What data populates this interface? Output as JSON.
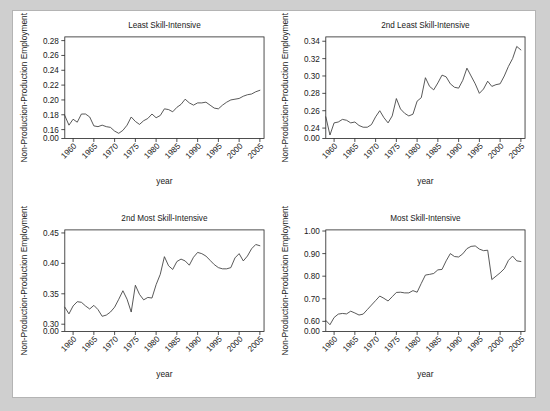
{
  "figure": {
    "background_color": "#cfcfcf",
    "panel_color": "#ffffff",
    "border_color": "#b4b4b4",
    "line_color": "#3a3a3a",
    "axis_color": "#222222"
  },
  "chart_data": [
    {
      "type": "line",
      "title": "Least Skill-Intensive",
      "xlabel": "year",
      "ylabel": "Non-Production-Production Employment",
      "grid": false,
      "legend": null,
      "xlim": [
        1958,
        2006
      ],
      "ylim": [
        0.148,
        0.285
      ],
      "xticks": [
        1960,
        1965,
        1970,
        1975,
        1980,
        1985,
        1990,
        1995,
        2000,
        2005
      ],
      "xtick_labels": [
        "1960",
        "1965",
        "1970",
        "1975",
        "1980",
        "1985",
        "1990",
        "1995",
        "2000",
        "2005"
      ],
      "yticks": [
        0.0,
        0.16,
        0.18,
        0.2,
        0.22,
        0.24,
        0.26,
        0.28
      ],
      "ytick_labels": [
        "0.00",
        "0.16",
        "0.18",
        "0.20",
        "0.22",
        "0.24",
        "0.26",
        "0.28"
      ],
      "x": [
        1958,
        1959,
        1960,
        1961,
        1962,
        1963,
        1964,
        1965,
        1966,
        1967,
        1968,
        1969,
        1970,
        1971,
        1972,
        1973,
        1974,
        1975,
        1976,
        1977,
        1978,
        1979,
        1980,
        1981,
        1982,
        1983,
        1984,
        1985,
        1986,
        1987,
        1988,
        1989,
        1990,
        1991,
        1992,
        1993,
        1994,
        1995,
        1996,
        1997,
        1998,
        1999,
        2000,
        2001,
        2002,
        2003,
        2004,
        2005
      ],
      "values": [
        0.179,
        0.166,
        0.174,
        0.17,
        0.181,
        0.181,
        0.177,
        0.165,
        0.164,
        0.166,
        0.164,
        0.163,
        0.158,
        0.155,
        0.159,
        0.166,
        0.177,
        0.171,
        0.167,
        0.172,
        0.175,
        0.181,
        0.176,
        0.179,
        0.188,
        0.187,
        0.184,
        0.19,
        0.194,
        0.201,
        0.196,
        0.193,
        0.196,
        0.196,
        0.197,
        0.193,
        0.189,
        0.188,
        0.193,
        0.197,
        0.2,
        0.201,
        0.202,
        0.205,
        0.207,
        0.208,
        0.211,
        0.213
      ]
    },
    {
      "type": "line",
      "title": "2nd Least Skill-Intensive",
      "xlabel": "year",
      "ylabel": "Non-Production-Production Employment",
      "grid": false,
      "legend": null,
      "xlim": [
        1958,
        2006
      ],
      "ylim": [
        0.228,
        0.345
      ],
      "xticks": [
        1960,
        1965,
        1970,
        1975,
        1980,
        1985,
        1990,
        1995,
        2000,
        2005
      ],
      "xtick_labels": [
        "1960",
        "1965",
        "1970",
        "1975",
        "1980",
        "1985",
        "1990",
        "1995",
        "2000",
        "2005"
      ],
      "yticks": [
        0.0,
        0.24,
        0.26,
        0.28,
        0.3,
        0.32,
        0.34
      ],
      "ytick_labels": [
        "0.00",
        "0.24",
        "0.26",
        "0.28",
        "0.30",
        "0.32",
        "0.34"
      ],
      "x": [
        1958,
        1959,
        1960,
        1961,
        1962,
        1963,
        1964,
        1965,
        1966,
        1967,
        1968,
        1969,
        1970,
        1971,
        1972,
        1973,
        1974,
        1975,
        1976,
        1977,
        1978,
        1979,
        1980,
        1981,
        1982,
        1983,
        1984,
        1985,
        1986,
        1987,
        1988,
        1989,
        1990,
        1991,
        1992,
        1993,
        1994,
        1995,
        1996,
        1997,
        1998,
        1999,
        2000,
        2001,
        2002,
        2003,
        2004,
        2005
      ],
      "values": [
        0.253,
        0.232,
        0.246,
        0.247,
        0.25,
        0.249,
        0.246,
        0.247,
        0.243,
        0.241,
        0.241,
        0.244,
        0.253,
        0.26,
        0.252,
        0.246,
        0.254,
        0.274,
        0.262,
        0.257,
        0.254,
        0.256,
        0.271,
        0.275,
        0.298,
        0.288,
        0.284,
        0.292,
        0.301,
        0.299,
        0.291,
        0.287,
        0.286,
        0.295,
        0.309,
        0.3,
        0.291,
        0.28,
        0.285,
        0.294,
        0.288,
        0.29,
        0.291,
        0.3,
        0.311,
        0.32,
        0.334,
        0.33
      ]
    },
    {
      "type": "line",
      "title": "2nd Most Skill-Intensive",
      "xlabel": "year",
      "ylabel": "Non-Production-Production Employment",
      "grid": false,
      "legend": null,
      "xlim": [
        1958,
        2006
      ],
      "ylim": [
        0.288,
        0.455
      ],
      "xticks": [
        1960,
        1965,
        1970,
        1975,
        1980,
        1985,
        1990,
        1995,
        2000,
        2005
      ],
      "xtick_labels": [
        "1960",
        "1965",
        "1970",
        "1975",
        "1980",
        "1985",
        "1990",
        "1995",
        "2000",
        "2005"
      ],
      "yticks": [
        0.0,
        0.3,
        0.35,
        0.4,
        0.45
      ],
      "ytick_labels": [
        "0.00",
        "0.30",
        "0.35",
        "0.40",
        "0.45"
      ],
      "x": [
        1958,
        1959,
        1960,
        1961,
        1962,
        1963,
        1964,
        1965,
        1966,
        1967,
        1968,
        1969,
        1970,
        1971,
        1972,
        1973,
        1974,
        1975,
        1976,
        1977,
        1978,
        1979,
        1980,
        1981,
        1982,
        1983,
        1984,
        1985,
        1986,
        1987,
        1988,
        1989,
        1990,
        1991,
        1992,
        1993,
        1994,
        1995,
        1996,
        1997,
        1998,
        1999,
        2000,
        2001,
        2002,
        2003,
        2004,
        2005
      ],
      "values": [
        0.328,
        0.317,
        0.33,
        0.337,
        0.336,
        0.33,
        0.325,
        0.331,
        0.324,
        0.313,
        0.315,
        0.32,
        0.328,
        0.341,
        0.355,
        0.341,
        0.32,
        0.364,
        0.349,
        0.34,
        0.344,
        0.343,
        0.365,
        0.382,
        0.411,
        0.396,
        0.39,
        0.403,
        0.407,
        0.404,
        0.397,
        0.41,
        0.418,
        0.416,
        0.412,
        0.405,
        0.398,
        0.393,
        0.391,
        0.391,
        0.393,
        0.409,
        0.416,
        0.404,
        0.412,
        0.424,
        0.431,
        0.429
      ]
    },
    {
      "type": "line",
      "title": "Most Skill-Intensive",
      "xlabel": "year",
      "ylabel": "Non-Production-Production Employment",
      "grid": false,
      "legend": null,
      "xlim": [
        1958,
        2006
      ],
      "ylim": [
        0.555,
        1.005
      ],
      "xticks": [
        1960,
        1965,
        1970,
        1975,
        1980,
        1985,
        1990,
        1995,
        2000,
        2005
      ],
      "xtick_labels": [
        "1960",
        "1965",
        "1970",
        "1975",
        "1980",
        "1985",
        "1990",
        "1995",
        "2000",
        "2005"
      ],
      "yticks": [
        0.0,
        0.6,
        0.7,
        0.8,
        0.9,
        1.0
      ],
      "ytick_labels": [
        "0.00",
        "0.60",
        "0.70",
        "0.80",
        "0.90",
        "1.00"
      ],
      "x": [
        1958,
        1959,
        1960,
        1961,
        1962,
        1963,
        1964,
        1965,
        1966,
        1967,
        1968,
        1969,
        1970,
        1971,
        1972,
        1973,
        1974,
        1975,
        1976,
        1977,
        1978,
        1979,
        1980,
        1981,
        1982,
        1983,
        1984,
        1985,
        1986,
        1987,
        1988,
        1989,
        1990,
        1991,
        1992,
        1993,
        1994,
        1995,
        1996,
        1997,
        1998,
        1999,
        2000,
        2001,
        2002,
        2003,
        2004,
        2005
      ],
      "values": [
        0.604,
        0.585,
        0.617,
        0.632,
        0.635,
        0.633,
        0.645,
        0.637,
        0.628,
        0.632,
        0.652,
        0.672,
        0.692,
        0.712,
        0.702,
        0.69,
        0.709,
        0.728,
        0.729,
        0.726,
        0.726,
        0.736,
        0.729,
        0.768,
        0.805,
        0.808,
        0.812,
        0.828,
        0.83,
        0.868,
        0.9,
        0.887,
        0.885,
        0.899,
        0.922,
        0.932,
        0.934,
        0.92,
        0.913,
        0.915,
        0.785,
        0.8,
        0.815,
        0.833,
        0.87,
        0.889,
        0.868,
        0.865
      ]
    }
  ]
}
